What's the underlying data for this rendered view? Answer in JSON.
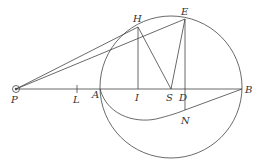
{
  "diagram": {
    "type": "geometric-figure",
    "colors": {
      "stroke": "#444444",
      "label": "#333333",
      "background": "#ffffff"
    },
    "points": {
      "P": {
        "label": "P",
        "x": 16,
        "y": 89
      },
      "L": {
        "label": "L",
        "x": 77,
        "y": 89
      },
      "A": {
        "label": "A",
        "x": 100,
        "y": 89
      },
      "I": {
        "label": "I",
        "x": 138,
        "y": 89
      },
      "S": {
        "label": "S",
        "x": 171,
        "y": 89
      },
      "D": {
        "label": "D",
        "x": 185,
        "y": 89
      },
      "B": {
        "label": "B",
        "x": 242,
        "y": 89
      },
      "H": {
        "label": "H",
        "x": 138,
        "y": 27
      },
      "E": {
        "label": "E",
        "x": 185,
        "y": 19
      },
      "N": {
        "label": "N",
        "x": 185,
        "y": 110
      }
    },
    "circle": {
      "cx": 171,
      "cy": 87,
      "r": 71
    },
    "segments": [
      "P-B",
      "P-H",
      "P-E",
      "H-I",
      "H-S",
      "E-S",
      "E-N"
    ],
    "curves": [
      "A-N-B"
    ]
  }
}
